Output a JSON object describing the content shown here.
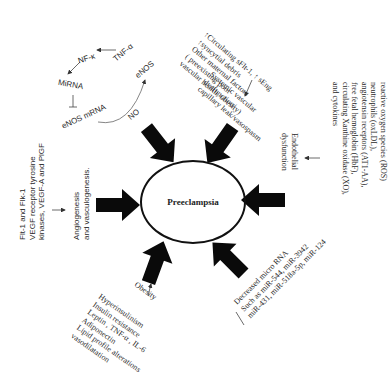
{
  "center": {
    "label": "Preeclampsia"
  },
  "enos_cycle": {
    "tnf": "TNF-α",
    "nfk": "NF-κ",
    "mirna": "MiRNA",
    "enos_mrna": "eNOS mRNA",
    "enos": "eNOS",
    "no": "NO"
  },
  "top_right": {
    "factors": "↑Circulating sFlt-1, ↑ sEng\n↑syncytial debris\nOther maternal factors\n( preexisting poor\nvascular health, obesity)",
    "result": "Systemic vascular\ndysfunction/\ncapillary leak/vasospasm"
  },
  "right": {
    "factors": "reactive oxygen species (ROS)\nneutrophils (oxLDL),\nangiotensin receptors (AT1-AA),\nfree fetal hemoglobin (HbF),\ncirculating Xanthine oxidase (XO),\nand cytokines",
    "result": "Endothelial\ndysfunction"
  },
  "bottom_right": {
    "text": "Decreased micro RNA\nSuch as miR-544, miR-3942\nmiR-431, miR-518a-5p, miR-124"
  },
  "bottom": {
    "result": "Obesity",
    "factors": "Hyperinsulinism\nInsulin resistance\nLeptin , TNF-α , IL-6\nAdiponectin\nLipid profile alterations\nvasodilatation"
  },
  "left": {
    "factors": "Flt-1 and Flk-1\nVEGF receptor tyrosine\nkinases, VEGF-A and PlGF",
    "result": "Angiogenesis\nand vasculogenesis."
  },
  "colors": {
    "arrow": "#0a0a0a",
    "text": "#2a2a2a",
    "line": "#555555"
  }
}
